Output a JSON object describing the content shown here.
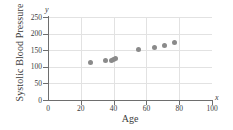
{
  "chart_data": {
    "type": "scatter",
    "title": "",
    "xlabel": "Age",
    "ylabel": "Systolic Blood Pressure",
    "x_axis_variable": "x",
    "y_axis_variable": "y",
    "xlim": [
      0,
      100
    ],
    "ylim": [
      0,
      250
    ],
    "xticks": [
      0,
      20,
      40,
      60,
      80,
      100
    ],
    "yticks": [
      0,
      50,
      100,
      150,
      200,
      250
    ],
    "xtick_labels": [
      "0",
      "20",
      "40",
      "60",
      "80",
      "100"
    ],
    "ytick_labels": [
      "0",
      "50",
      "100",
      "150",
      "200",
      "250"
    ],
    "grid": true,
    "legend": "none",
    "marker_color": "#8a8a8a",
    "axis_color": "#6e6e6e",
    "grid_color": "#e2e2e2",
    "points": [
      {
        "x": 26,
        "y": 113
      },
      {
        "x": 35,
        "y": 118
      },
      {
        "x": 39,
        "y": 118
      },
      {
        "x": 40,
        "y": 122
      },
      {
        "x": 41,
        "y": 124
      },
      {
        "x": 55,
        "y": 152
      },
      {
        "x": 65,
        "y": 157
      },
      {
        "x": 71,
        "y": 163
      },
      {
        "x": 77,
        "y": 172
      }
    ]
  }
}
